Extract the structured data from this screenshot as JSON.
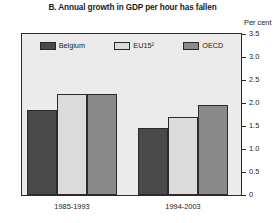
{
  "chart_data": {
    "type": "bar",
    "title": "B. Annual growth in GDP per hour has fallen",
    "xlabel": "",
    "ylabel": "Per cent",
    "ylim": [
      0,
      3.5
    ],
    "yticks": [
      "0",
      "0.5",
      "1.0",
      "1.5",
      "2.0",
      "2.5",
      "3.0",
      "3.5"
    ],
    "ytick_values": [
      0,
      0.5,
      1.0,
      1.5,
      2.0,
      2.5,
      3.0,
      3.5
    ],
    "grid": false,
    "legend_position": "top-inside",
    "categories": [
      "1985-1993",
      "1994-2003"
    ],
    "series": [
      {
        "name": "Belgium",
        "color": "#4a4a4a",
        "values": [
          1.85,
          1.45
        ]
      },
      {
        "name": "EU15²",
        "color": "#dcdcdc",
        "values": [
          2.2,
          1.7
        ]
      },
      {
        "name": "OECD",
        "color": "#8a8a8a",
        "values": [
          2.2,
          1.95
        ]
      }
    ]
  },
  "legend": {
    "items": [
      {
        "label": "Belgium",
        "swatch_name": "legend-swatch-belgium"
      },
      {
        "label": "EU15²",
        "swatch_name": "legend-swatch-eu15"
      },
      {
        "label": "OECD",
        "swatch_name": "legend-swatch-oecd"
      }
    ]
  },
  "colors": {
    "belgium": "#4a4a4a",
    "eu15": "#dcdcdc",
    "oecd": "#8a8a8a",
    "plot_background": "#ebebeb",
    "axis": "#2b2b2b",
    "page_background": "#ffffff"
  }
}
